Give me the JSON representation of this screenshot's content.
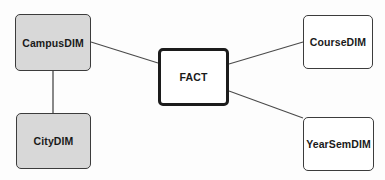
{
  "diagram": {
    "type": "star-schema-er-diagram",
    "background_color": "#fdfdfd",
    "nodes": [
      {
        "id": "campus_dim",
        "label": "CampusDIM",
        "role": "dimension",
        "fill_color": "#d8d8d8",
        "border_color": "#3c3c3c",
        "x": 15,
        "y": 14,
        "width": 76,
        "height": 57
      },
      {
        "id": "city_dim",
        "label": "CityDIM",
        "role": "dimension",
        "fill_color": "#d8d8d8",
        "border_color": "#3c3c3c",
        "x": 16,
        "y": 113,
        "width": 75,
        "height": 56
      },
      {
        "id": "fact",
        "label": "FACT",
        "role": "fact",
        "fill_color": "#ffffff",
        "border_color": "#1c1c1c",
        "x": 158,
        "y": 48,
        "width": 71,
        "height": 58
      },
      {
        "id": "course_dim",
        "label": "CourseDIM",
        "role": "dimension",
        "fill_color": "#ffffff",
        "border_color": "#3c3c3c",
        "x": 303,
        "y": 15,
        "width": 70,
        "height": 54
      },
      {
        "id": "yearsem_dim",
        "label": "YearSemDIM",
        "role": "dimension",
        "fill_color": "#ffffff",
        "border_color": "#3c3c3c",
        "x": 303,
        "y": 117,
        "width": 71,
        "height": 54
      }
    ],
    "edges": [
      {
        "id": "edge-campus-fact",
        "from": "campus_dim",
        "to": "fact",
        "x1": 91,
        "y1": 42,
        "x2": 158,
        "y2": 63,
        "color": "#4a4a4a"
      },
      {
        "id": "edge-campus-city",
        "from": "campus_dim",
        "to": "city_dim",
        "x1": 53,
        "y1": 71,
        "x2": 53,
        "y2": 113,
        "color": "#4a4a4a"
      },
      {
        "id": "edge-fact-course",
        "from": "fact",
        "to": "course_dim",
        "x1": 229,
        "y1": 64,
        "x2": 303,
        "y2": 42,
        "color": "#4a4a4a"
      },
      {
        "id": "edge-fact-yearsem",
        "from": "fact",
        "to": "yearsem_dim",
        "x1": 229,
        "y1": 91,
        "x2": 303,
        "y2": 118,
        "color": "#4a4a4a"
      }
    ]
  }
}
